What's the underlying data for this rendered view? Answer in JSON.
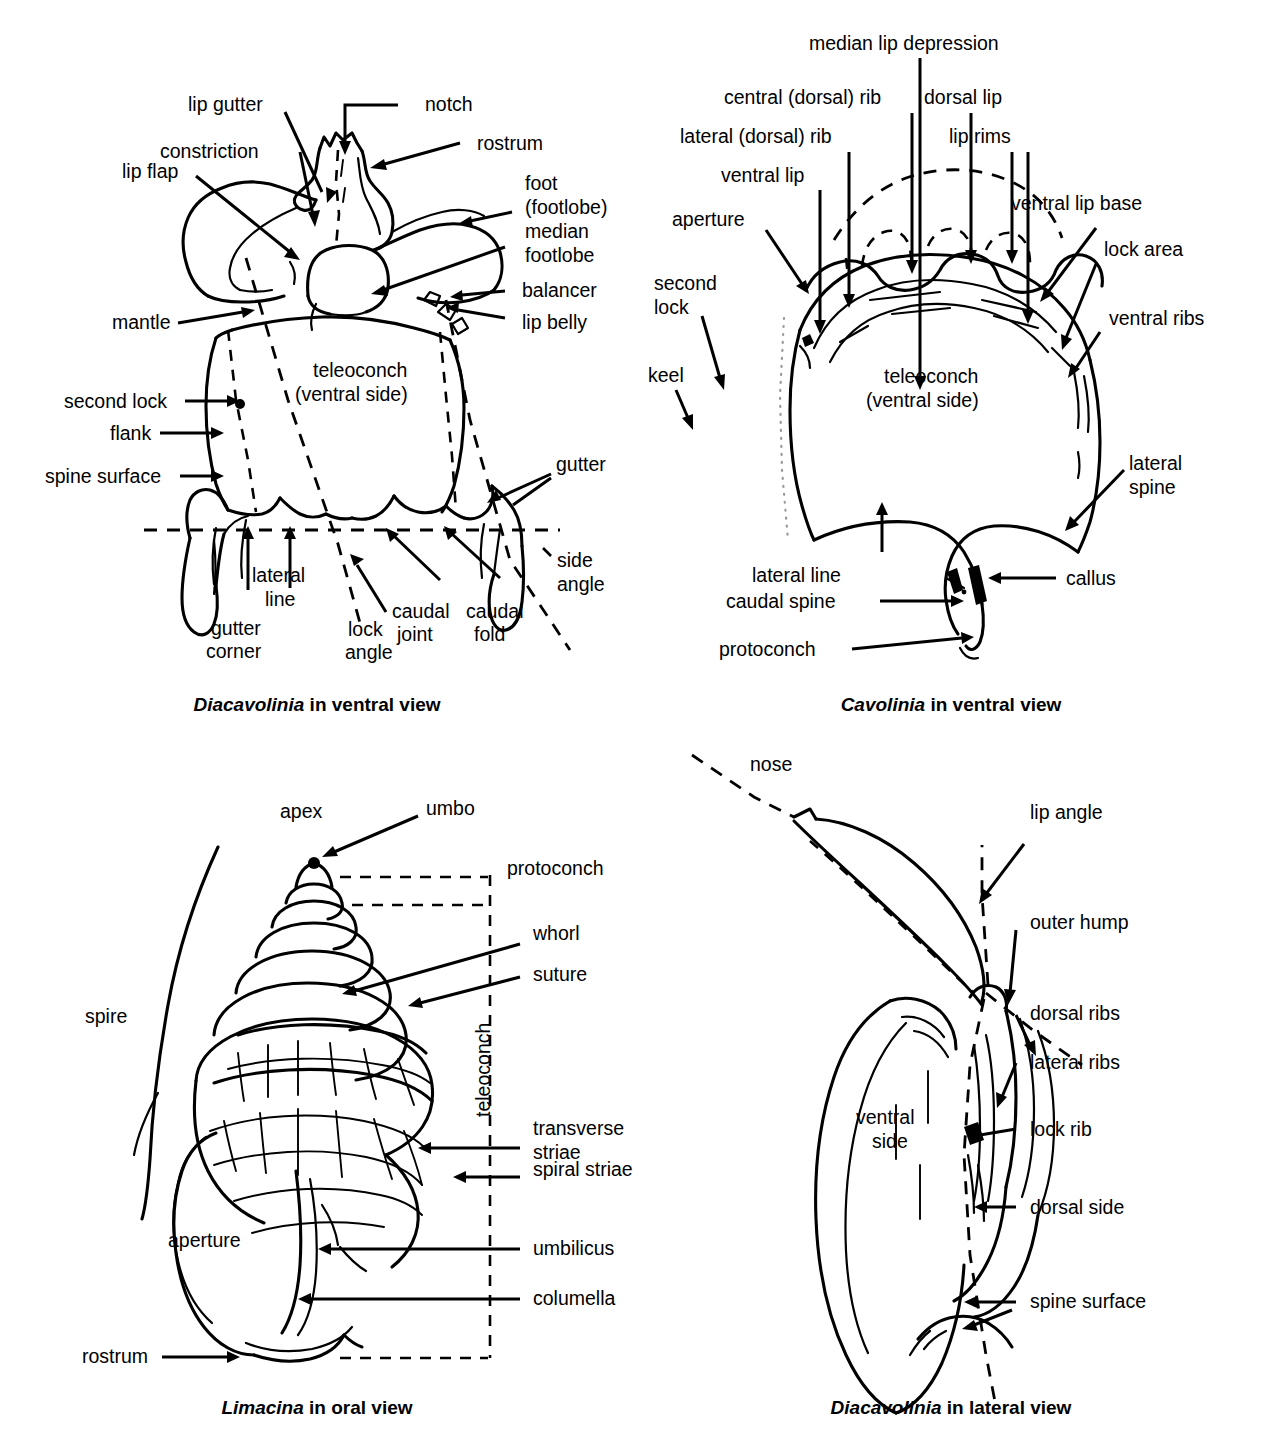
{
  "figure": {
    "panels": [
      {
        "id": "diacavolinia-ventral",
        "caption_genus": "Diacavolinia",
        "caption_rest": " in ventral view",
        "interior_labels": [
          "teleoconch",
          "(ventral side)"
        ],
        "labels": [
          "lip gutter",
          "notch",
          "constriction",
          "rostrum",
          "lip flap",
          "foot",
          "(footlobe)",
          "median",
          "footlobe",
          "balancer",
          "lip belly",
          "mantle",
          "second lock",
          "flank",
          "spine surface",
          "gutter",
          "side",
          "angle",
          "lateral",
          "line",
          "gutter",
          "corner",
          "lock",
          "angle",
          "caudal",
          "joint",
          "caudal",
          "fold"
        ]
      },
      {
        "id": "cavolinia-ventral",
        "caption_genus": "Cavolinia",
        "caption_rest": " in ventral view",
        "interior_labels": [
          "teleoconch",
          "(ventral side)"
        ],
        "labels": [
          "median lip depression",
          "central (dorsal) rib",
          "dorsal lip",
          "lateral (dorsal) rib",
          "lip rims",
          "ventral lip",
          "ventral lip base",
          "aperture",
          "lock area",
          "second",
          "lock",
          "ventral ribs",
          "keel",
          "lateral",
          "spine",
          "lateral line",
          "callus",
          "caudal spine",
          "protoconch"
        ]
      },
      {
        "id": "limacina-oral",
        "caption_genus": "Limacina",
        "caption_rest": " in oral view",
        "interior_labels": [
          "aperture",
          "teleoconch"
        ],
        "labels": [
          "apex",
          "umbo",
          "protoconch",
          "whorl",
          "suture",
          "spire",
          "transverse",
          "striae",
          "spiral striae",
          "umbilicus",
          "columella",
          "rostrum"
        ]
      },
      {
        "id": "diacavolinia-lateral",
        "caption_genus": "Diacavolinia",
        "caption_rest": " in lateral view",
        "interior_labels": [
          "ventral",
          "side"
        ],
        "labels": [
          "nose",
          "lip angle",
          "outer hump",
          "dorsal ribs",
          "lateral ribs",
          "lock rib",
          "dorsal side",
          "spine surface"
        ]
      }
    ]
  },
  "p1": {
    "lip_gutter": "lip gutter",
    "notch": "notch",
    "constriction": "constriction",
    "rostrum": "rostrum",
    "lip_flap": "lip flap",
    "foot": "foot",
    "footlobe_paren": "(footlobe)",
    "median": "median",
    "footlobe": "footlobe",
    "balancer": "balancer",
    "lip_belly": "lip belly",
    "mantle": "mantle",
    "second_lock": "second lock",
    "flank": "flank",
    "spine_surface": "spine surface",
    "gutter": "gutter",
    "side": "side",
    "angle": "angle",
    "lateral": "lateral",
    "line": "line",
    "gutter2": "gutter",
    "corner": "corner",
    "lock": "lock",
    "lock_angle2": "angle",
    "caudal": "caudal",
    "joint": "joint",
    "caudal2": "caudal",
    "fold": "fold",
    "teleoconch": "teleoconch",
    "ventral_side": "(ventral side)",
    "caption_genus": "Diacavolinia",
    "caption_rest": " in ventral view"
  },
  "p2": {
    "median_lip_depression": "median lip depression",
    "central_dorsal_rib": "central (dorsal) rib",
    "dorsal_lip": "dorsal lip",
    "lateral_dorsal_rib": "lateral (dorsal) rib",
    "lip_rims": "lip rims",
    "ventral_lip": "ventral lip",
    "ventral_lip_base": "ventral lip base",
    "aperture": "aperture",
    "lock_area": "lock area",
    "second": "second",
    "lock": "lock",
    "ventral_ribs": "ventral ribs",
    "keel": "keel",
    "lateral": "lateral",
    "spine": "spine",
    "lateral_line": "lateral line",
    "callus": "callus",
    "caudal_spine": "caudal spine",
    "protoconch": "protoconch",
    "teleoconch": "teleoconch",
    "ventral_side": "(ventral side)",
    "caption_genus": "Cavolinia",
    "caption_rest": " in ventral view"
  },
  "p3": {
    "apex": "apex",
    "umbo": "umbo",
    "protoconch": "protoconch",
    "whorl": "whorl",
    "suture": "suture",
    "spire": "spire",
    "teleoconch": "teleoconch",
    "transverse": "transverse",
    "striae": "striae",
    "spiral_striae": "spiral striae",
    "umbilicus": "umbilicus",
    "columella": "columella",
    "aperture": "aperture",
    "rostrum": "rostrum",
    "caption_genus": "Limacina",
    "caption_rest": " in oral view"
  },
  "p4": {
    "nose": "nose",
    "lip_angle": "lip angle",
    "outer_hump": "outer hump",
    "dorsal_ribs": "dorsal ribs",
    "lateral_ribs": "lateral ribs",
    "lock_rib": "lock rib",
    "dorsal_side": "dorsal side",
    "spine_surface": "spine surface",
    "ventral": "ventral",
    "side": "side",
    "caption_genus": "Diacavolinia",
    "caption_rest": " in lateral view"
  },
  "colors": {
    "ink": "#000000",
    "background": "#ffffff",
    "guide_dot": "#9a9a9a"
  }
}
